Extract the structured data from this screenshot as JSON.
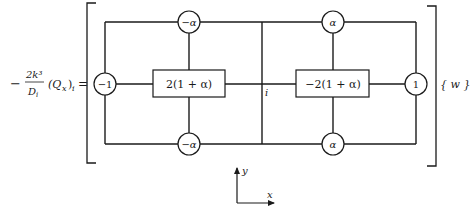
{
  "equation": {
    "lhs_sign": "−",
    "lhs_numerator": "2k³",
    "lhs_denominator": "D",
    "lhs_denominator_sub": "i",
    "lhs_term": "(Q",
    "lhs_term_sub": "x",
    "lhs_term_close": ")",
    "lhs_term_outer_sub": "i",
    "equals": "="
  },
  "stencil": {
    "nodes": {
      "top_left": "−α",
      "top_right": "α",
      "bottom_left": "−α",
      "bottom_right": "α",
      "left": "−1",
      "right": "1"
    },
    "boxes": {
      "left": "2(1 + α)",
      "right": "−2(1 + α)"
    },
    "center_label": "i"
  },
  "vector_label": "{ w }",
  "axes": {
    "x_label": "x",
    "y_label": "y"
  },
  "colors": {
    "line": "#1a1a1a",
    "background": "#ffffff"
  }
}
